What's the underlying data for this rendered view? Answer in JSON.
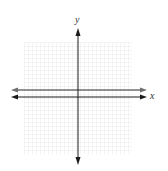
{
  "diagram": {
    "type": "coordinate-plane-graph",
    "axes": {
      "x_label": "x",
      "y_label": "y"
    },
    "grid": {
      "left": 24,
      "top": 42,
      "right": 132,
      "bottom": 154,
      "cell": 4,
      "color": "#e4e4e4"
    },
    "origin_px": {
      "x": 78,
      "y": 97
    },
    "lines": [
      {
        "name": "horizontal-line",
        "description": "horizontal line slightly above x-axis",
        "y_px": 90,
        "color": "#6e6e6e"
      }
    ],
    "colors": {
      "axis": "#1a1a1a",
      "line": "#6e6e6e"
    }
  }
}
